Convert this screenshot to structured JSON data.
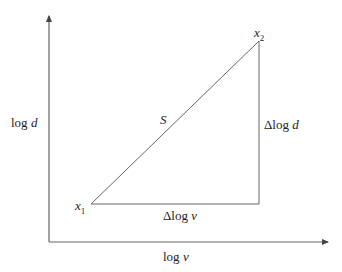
{
  "diagram": {
    "axes": {
      "y_label": {
        "prefix": "log ",
        "var": "d"
      },
      "x_label": {
        "prefix": "log ",
        "var": "v"
      }
    },
    "points": {
      "x1": {
        "name": "x",
        "sub": "1"
      },
      "x2": {
        "name": "x",
        "sub": "2"
      }
    },
    "segment_label": "S",
    "delta_y_label": {
      "prefix": "Δlog ",
      "var": "d"
    },
    "delta_x_label": {
      "prefix": "Δlog ",
      "var": "v"
    },
    "colors": {
      "line": "#555555",
      "axis": "#555555"
    }
  }
}
